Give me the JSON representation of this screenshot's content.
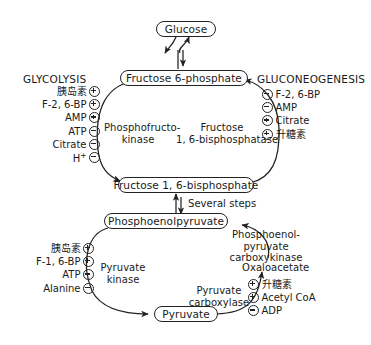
{
  "diagram": {
    "nodes": {
      "glucose": "Glucose",
      "f6p": "Fructose 6-phosphate",
      "f16bp": "Fructose 1, 6-bisphosphate",
      "pep": "Phosphoenolpyruvate",
      "pyruvate": "Pyruvate"
    },
    "intermediates": {
      "oxaloacetate": "Oxaloacetate"
    },
    "headings": {
      "glycolysis": "GLYCOLYSIS",
      "gluconeogenesis": "GLUCONEOGENESIS"
    },
    "enzymes": {
      "pfk_line1": "Phosphofructo-",
      "pfk_line2": "kinase",
      "fbpase_line1": "Fructose",
      "fbpase_line2": "1, 6-bisphosphatase",
      "pk_line1": "Pyruvate",
      "pk_line2": "kinase",
      "pepck_line1": "Phosphoenol-",
      "pepck_line2": "pyruvate",
      "pepck_line3": "carboxykinase",
      "pc_line1": "Pyruvate",
      "pc_line2": "carboxylase"
    },
    "edge_labels": {
      "several_steps": "Several steps"
    },
    "regulators": {
      "pfk": [
        {
          "name": "胰岛素",
          "sign": "plus"
        },
        {
          "name": "F-2, 6-BP",
          "sign": "plus"
        },
        {
          "name": "AMP",
          "sign": "plus"
        },
        {
          "name": "ATP",
          "sign": "minus"
        },
        {
          "name": "Citrate",
          "sign": "minus"
        },
        {
          "name": "H",
          "superscript": "+",
          "sign": "minus"
        }
      ],
      "fbpase": [
        {
          "sign": "minus",
          "name": "F-2, 6-BP"
        },
        {
          "sign": "minus",
          "name": "AMP"
        },
        {
          "sign": "plus",
          "name": "Citrate"
        },
        {
          "sign": "plus",
          "name": "升糖素"
        }
      ],
      "pyruvate_kinase": [
        {
          "name": "胰岛素",
          "sign": "plus"
        },
        {
          "name": "F-1, 6-BP",
          "sign": "plus"
        },
        {
          "name": "ATP",
          "sign": "minus"
        },
        {
          "name": "Alanine",
          "sign": "minus"
        }
      ],
      "pyruvate_carboxylase": [
        {
          "sign": "plus",
          "name": "升糖素"
        },
        {
          "sign": "plus",
          "name": "Acetyl CoA"
        },
        {
          "sign": "minus",
          "name": "ADP"
        }
      ]
    },
    "colors": {
      "stroke": "#222222",
      "background": "#ffffff",
      "text": "#1a1a1a"
    }
  }
}
